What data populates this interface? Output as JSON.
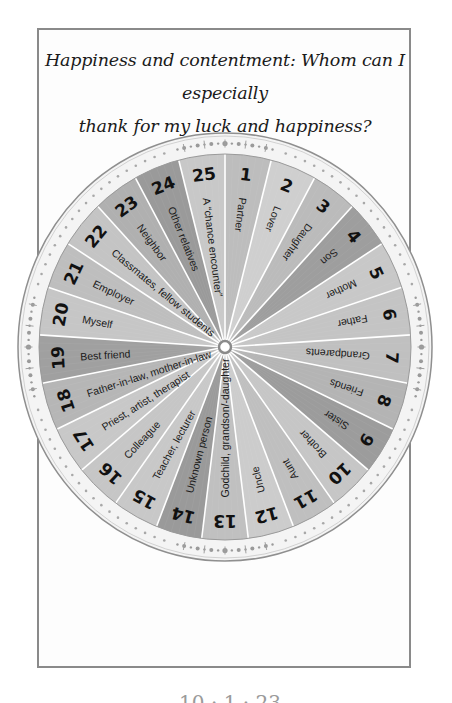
{
  "page": {
    "title_line1": "Happiness and contentment: Whom can I especially",
    "title_line2": "thank for my luck and happiness?",
    "footer_cut_text": "10 · 1 · 23"
  },
  "wheel": {
    "center": [
      225,
      347
    ],
    "inner_radius": [
      186,
      193
    ],
    "outer_radius": [
      207,
      214
    ],
    "hub_radius": 6,
    "ring_color": "#f4f4f4",
    "ring_stroke": "#8f8f8f",
    "divider_color": "#ffffff",
    "segments": [
      {
        "number": "1",
        "label": "Partner",
        "shade": "#bdbdbd"
      },
      {
        "number": "2",
        "label": "Lover",
        "shade": "#cfcfcf"
      },
      {
        "number": "3",
        "label": "Daughter",
        "shade": "#bbbbbb"
      },
      {
        "number": "4",
        "label": "Son",
        "shade": "#9e9e9e"
      },
      {
        "number": "5",
        "label": "Mother",
        "shade": "#c8c8c8"
      },
      {
        "number": "6",
        "label": "Father",
        "shade": "#c4c4c4"
      },
      {
        "number": "7",
        "label": "Grandparents",
        "shade": "#c0c0c0"
      },
      {
        "number": "8",
        "label": "Friends",
        "shade": "#b4b4b4"
      },
      {
        "number": "9",
        "label": "Sister",
        "shade": "#9c9c9c"
      },
      {
        "number": "10",
        "label": "Brother",
        "shade": "#c6c6c6"
      },
      {
        "number": "11",
        "label": "Aunt",
        "shade": "#bfbfbf"
      },
      {
        "number": "12",
        "label": "Uncle",
        "shade": "#cccccc"
      },
      {
        "number": "13",
        "label": "Godchild, grandson/-daughter",
        "shade": "#c0c0c0"
      },
      {
        "number": "14",
        "label": "Unknown person",
        "shade": "#9a9a9a"
      },
      {
        "number": "15",
        "label": "Teacher, lecturer",
        "shade": "#c8c8c8"
      },
      {
        "number": "16",
        "label": "Colleague",
        "shade": "#c6c6c6"
      },
      {
        "number": "17",
        "label": "Priest, artist, therapist",
        "shade": "#c8c8c8"
      },
      {
        "number": "18",
        "label": "Father-in-law, mother-in-law",
        "shade": "#b6b6b6"
      },
      {
        "number": "19",
        "label": "Best friend",
        "shade": "#a0a0a0"
      },
      {
        "number": "20",
        "label": "Myself",
        "shade": "#c6c6c6"
      },
      {
        "number": "21",
        "label": "Employer",
        "shade": "#bebebe"
      },
      {
        "number": "22",
        "label": "Classmates, fellow students",
        "shade": "#c4c4c4"
      },
      {
        "number": "23",
        "label": "Neighbor",
        "shade": "#b0b0b0"
      },
      {
        "number": "24",
        "label": "Other relatives",
        "shade": "#9a9a9a"
      },
      {
        "number": "25",
        "label": "A “chance encounter”",
        "shade": "#c8c8c8"
      }
    ]
  }
}
